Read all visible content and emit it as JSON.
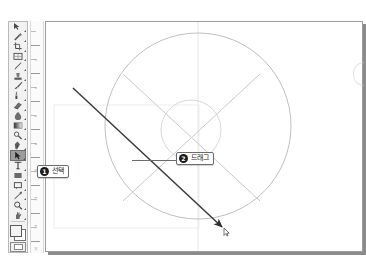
{
  "app": {
    "type": "image-editor",
    "accent_color": "#1b1b1b",
    "canvas_bg": "#ffffff",
    "guide_color": "#c9c9c9",
    "drag_line_color": "#3a3a3a"
  },
  "toolbar": {
    "name": "tools-palette",
    "selected_index": 13,
    "tools": [
      {
        "name": "move-tool",
        "label": "Move"
      },
      {
        "name": "magic-wand-tool",
        "label": "Magic Wand"
      },
      {
        "name": "crop-tool",
        "label": "Crop"
      },
      {
        "name": "slice-tool",
        "label": "Slice"
      },
      {
        "name": "healing-brush-tool",
        "label": "Healing Brush"
      },
      {
        "name": "stamp-tool",
        "label": "Clone Stamp"
      },
      {
        "name": "brush-tool",
        "label": "Brush"
      },
      {
        "name": "history-brush-tool",
        "label": "History Brush"
      },
      {
        "name": "eraser-tool",
        "label": "Eraser"
      },
      {
        "name": "blur-tool",
        "label": "Blur"
      },
      {
        "name": "gradient-tool",
        "label": "Gradient"
      },
      {
        "name": "dodge-tool",
        "label": "Dodge"
      },
      {
        "name": "pen-tool",
        "label": "Pen"
      },
      {
        "name": "path-selection-tool",
        "label": "Path Selection"
      },
      {
        "name": "type-tool",
        "label": "Type"
      },
      {
        "name": "shape-tool",
        "label": "Shape"
      },
      {
        "name": "notes-tool",
        "label": "Notes"
      },
      {
        "name": "eyedropper-tool",
        "label": "Eyedropper"
      },
      {
        "name": "zoom-tool",
        "label": "Zoom"
      },
      {
        "name": "hand-tool",
        "label": "Hand"
      }
    ],
    "foreground_color": "#f4f4f4",
    "background_color": "#ffffff",
    "quick_mask_label": "Quick Mask"
  },
  "ruler": {
    "name": "vertical-ruler",
    "marks": [
      "2",
      "4",
      "6",
      "8",
      "10",
      "12",
      "14",
      "16"
    ]
  },
  "canvas": {
    "name": "document-canvas",
    "shapes": [
      {
        "name": "outer-circle-guide",
        "type": "circle",
        "cx": 152,
        "cy": 104,
        "r": 93
      },
      {
        "name": "inner-circle-guide",
        "type": "circle",
        "cx": 145,
        "cy": 108,
        "r": 30
      },
      {
        "name": "diagonal-guide-down",
        "type": "line",
        "x1": 77,
        "y1": 52,
        "x2": 214,
        "y2": 179
      },
      {
        "name": "diagonal-guide-up",
        "type": "line",
        "x1": 214,
        "y1": 52,
        "x2": 77,
        "y2": 179
      },
      {
        "name": "vertical-guide",
        "type": "line",
        "x1": 152,
        "y1": 0,
        "x2": 152,
        "y2": 231
      },
      {
        "name": "bounding-box-guide",
        "type": "rect",
        "x": 8,
        "y": 83,
        "w": 145,
        "h": 123
      }
    ],
    "drag_line": {
      "name": "drag-stroke",
      "x1": 27,
      "y1": 66,
      "x2": 176,
      "y2": 205,
      "has_arrowhead": true
    },
    "cursor": {
      "name": "pointer-cursor",
      "x": 180,
      "y": 210
    }
  },
  "callouts": [
    {
      "name": "callout-select",
      "number": "1",
      "text": "선택",
      "left": 37,
      "top": 165
    },
    {
      "name": "callout-drag",
      "number": "2",
      "text": "드래그",
      "left": 176,
      "top": 152
    }
  ]
}
